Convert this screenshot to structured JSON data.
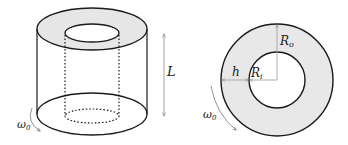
{
  "figure": {
    "left_panel": {
      "description": "Annular cylinder (3D view)",
      "height_label": "L",
      "rotation_label": {
        "main": "ω",
        "sub": "0"
      }
    },
    "right_panel": {
      "description": "Annulus cross-section (top view)",
      "outer_radius_label": {
        "main": "R",
        "sub": "o"
      },
      "inner_radius_label": {
        "main": "R",
        "sub": "i"
      },
      "gap_label": "h",
      "rotation_label": {
        "main": "ω",
        "sub": "0"
      }
    },
    "colors": {
      "stroke": "#1a1a1a",
      "fill_annulus": "#e6e6e6",
      "guide_line": "#9a9a9a"
    }
  }
}
